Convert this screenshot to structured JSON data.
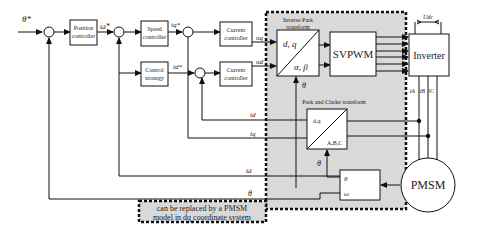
{
  "diagram": {
    "type": "control block diagram",
    "inputs": {
      "theta_ref": "θ*"
    },
    "blocks": {
      "position_controller": {
        "line1": "Position",
        "line2": "controller"
      },
      "speed_controller": {
        "line1": "Speed",
        "line2": "controller"
      },
      "control_strategy": {
        "line1": "Control",
        "line2": "strategy"
      },
      "current_controller_q": {
        "line1": "Current",
        "line2": "controller"
      },
      "current_controller_d": {
        "line1": "Current",
        "line2": "controller"
      },
      "inverse_park": {
        "title1": "Inverse Park",
        "title2": "transform",
        "top": "d, q",
        "bottom": "α, β"
      },
      "svpwm": {
        "label": "SVPWM"
      },
      "inverter": {
        "label": "Inverter",
        "dc": "Udc"
      },
      "park_clarke": {
        "title": "Park and Clarke transform",
        "top": "d,q",
        "bottom": "A,B,C"
      },
      "sensor": {
        "top": "θ",
        "bottom": "ω"
      },
      "pmsm": {
        "label": "PMSM"
      }
    },
    "signals": {
      "omega_ref": "ω*",
      "iq_ref": "iq*",
      "id_ref": "id*",
      "uq": "uq",
      "ud": "ud",
      "theta": "θ",
      "id": "id",
      "iq": "iq",
      "omega": "ω",
      "iA": "iA",
      "iB": "iB",
      "iC": "iC"
    },
    "note": {
      "line1": "can be replaced by a PMSM",
      "line2": "model in dq coordinate system"
    }
  }
}
